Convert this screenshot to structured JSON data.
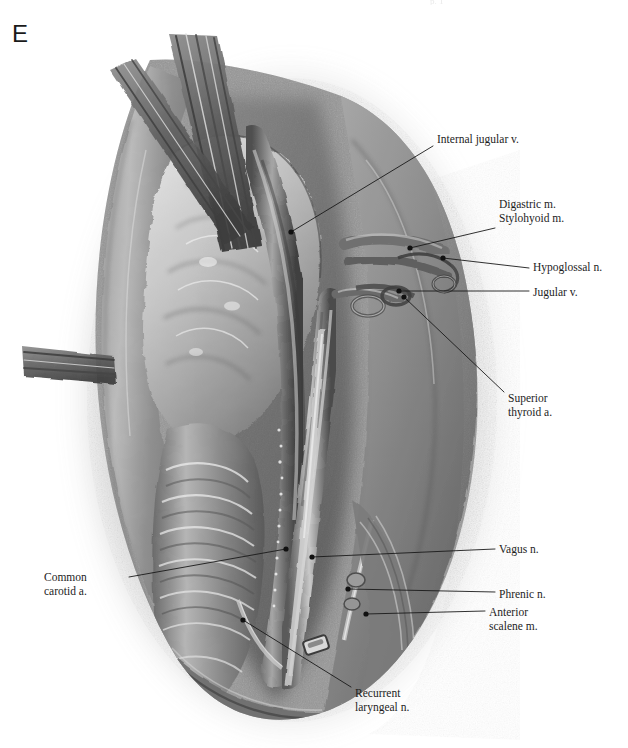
{
  "figure": {
    "panel_letter": "E",
    "page_header_remnant": "p. 1",
    "medium": "grayscale pencil and wash anatomical illustration"
  },
  "colors": {
    "background": "#ffffff",
    "ink": "#1d1d1d",
    "leader_line": "#1a1a1a",
    "leader_dot": "#111111",
    "tissue_mid": "#8e8e8e",
    "tissue_dark": "#4a4a4a",
    "tissue_light": "#cfcfcf",
    "highlight": "#f2f2f2",
    "stipple": "#9a9a9a"
  },
  "labels": [
    {
      "id": "internal-jugular-v",
      "lines": [
        "Internal jugular v."
      ],
      "side": "right",
      "text_x": 437,
      "text_y": 133,
      "leader": {
        "x1": 433,
        "y1": 146,
        "x2": 291,
        "y2": 232
      },
      "dot": {
        "x": 291,
        "y": 232
      }
    },
    {
      "id": "digastric-stylohyoid-m",
      "lines": [
        "Digastric m.",
        "Stylohyoid m."
      ],
      "side": "right",
      "text_x": 499,
      "text_y": 198,
      "leader": {
        "x1": 495,
        "y1": 228,
        "x2": 410,
        "y2": 248
      },
      "dot": {
        "x": 410,
        "y": 248
      }
    },
    {
      "id": "hypoglossal-n",
      "lines": [
        "Hypoglossal n."
      ],
      "side": "right",
      "text_x": 533,
      "text_y": 261,
      "leader": {
        "x1": 529,
        "y1": 268,
        "x2": 443,
        "y2": 258
      },
      "dot": {
        "x": 443,
        "y": 258
      }
    },
    {
      "id": "jugular-v",
      "lines": [
        "Jugular v."
      ],
      "side": "right",
      "text_x": 533,
      "text_y": 286,
      "leader": {
        "x1": 529,
        "y1": 291,
        "x2": 399,
        "y2": 291
      },
      "dot": {
        "x": 399,
        "y": 291
      }
    },
    {
      "id": "superior-thyroid-a",
      "lines": [
        "Superior",
        "thyroid a."
      ],
      "side": "right",
      "text_x": 508,
      "text_y": 392,
      "leader": {
        "x1": 504,
        "y1": 392,
        "x2": 404,
        "y2": 297
      },
      "dot": {
        "x": 404,
        "y": 297
      }
    },
    {
      "id": "vagus-n",
      "lines": [
        "Vagus n."
      ],
      "side": "right",
      "text_x": 499,
      "text_y": 543,
      "leader": {
        "x1": 495,
        "y1": 549,
        "x2": 312,
        "y2": 557
      },
      "dot": {
        "x": 312,
        "y": 557
      }
    },
    {
      "id": "phrenic-n",
      "lines": [
        "Phrenic n."
      ],
      "side": "right",
      "text_x": 499,
      "text_y": 588,
      "leader": {
        "x1": 495,
        "y1": 592,
        "x2": 348,
        "y2": 589
      },
      "dot": {
        "x": 348,
        "y": 589
      }
    },
    {
      "id": "anterior-scalene-m",
      "lines": [
        "Anterior",
        "scalene m."
      ],
      "side": "right",
      "text_x": 489,
      "text_y": 606,
      "leader": {
        "x1": 485,
        "y1": 611,
        "x2": 366,
        "y2": 614
      },
      "dot": {
        "x": 366,
        "y": 614
      }
    },
    {
      "id": "common-carotid-a",
      "lines": [
        "Common",
        "carotid a."
      ],
      "side": "left",
      "text_x": 44,
      "text_y": 571,
      "leader": {
        "x1": 129,
        "y1": 577,
        "x2": 286,
        "y2": 549
      },
      "dot": {
        "x": 286,
        "y": 549
      }
    },
    {
      "id": "recurrent-laryngeal-n",
      "lines": [
        "Recurrent",
        "laryngeal n."
      ],
      "side": "right",
      "text_x": 355,
      "text_y": 687,
      "leader": {
        "x1": 351,
        "y1": 687,
        "x2": 243,
        "y2": 620
      },
      "dot": {
        "x": 243,
        "y": 620
      }
    }
  ]
}
